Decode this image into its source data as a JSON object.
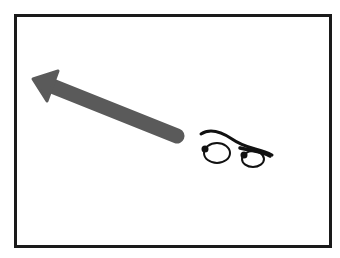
{
  "illustration": {
    "frame_color": "#1a1a1a",
    "background_color": "#ffffff",
    "arrow": {
      "icon": "arrow-up-left-icon",
      "color": "#5a5a5a",
      "direction": "up-left"
    },
    "eyes": {
      "icon": "eyes-icon",
      "color": "#111111",
      "looking": "left"
    }
  }
}
